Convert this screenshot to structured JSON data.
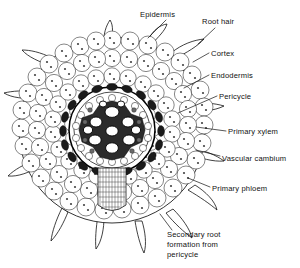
{
  "figure": {
    "background_color": "#ffffff",
    "ink_color": "#111111",
    "width": 300,
    "height": 268
  },
  "labels": [
    {
      "id": "epidermis",
      "text": "Epidermis",
      "lines": [
        "Epidermis"
      ],
      "x": 140,
      "y": 17,
      "anchor": "start"
    },
    {
      "id": "root-hair",
      "text": "Root hair",
      "lines": [
        "Root hair"
      ],
      "x": 202,
      "y": 24,
      "anchor": "start"
    },
    {
      "id": "cortex",
      "text": "Cortex",
      "lines": [
        "Cortex"
      ],
      "x": 211,
      "y": 56,
      "anchor": "start"
    },
    {
      "id": "endodermis",
      "text": "Endodermis",
      "lines": [
        "Endodermis"
      ],
      "x": 211,
      "y": 78,
      "anchor": "start"
    },
    {
      "id": "pericycle",
      "text": "Pericycle",
      "lines": [
        "Pericycle"
      ],
      "x": 219,
      "y": 99,
      "anchor": "start"
    },
    {
      "id": "primary-xylem",
      "text": "Primary xylem",
      "lines": [
        "Primary xylem"
      ],
      "x": 228,
      "y": 134,
      "anchor": "start"
    },
    {
      "id": "vascular-cambium",
      "text": "Vascular cambium",
      "lines": [
        "Vascular cambium"
      ],
      "x": 222,
      "y": 161,
      "anchor": "start"
    },
    {
      "id": "primary-phloem",
      "text": "Primary phloem",
      "lines": [
        "Primary phloem"
      ],
      "x": 212,
      "y": 191,
      "anchor": "start"
    },
    {
      "id": "secondary-root",
      "text": "Secondary root formation from pericycle",
      "lines": [
        "Secondary root",
        "formation from",
        "pericycle"
      ],
      "x": 167,
      "y": 237,
      "anchor": "start"
    }
  ],
  "structures": [
    {
      "id": "root-outline",
      "name": "root cross-section outline"
    },
    {
      "id": "epidermis-layer",
      "name": "epidermis cell layer"
    },
    {
      "id": "cortex-layer",
      "name": "cortex parenchyma cells"
    },
    {
      "id": "endodermis-ring",
      "name": "endodermis ring"
    },
    {
      "id": "pericycle-ring",
      "name": "pericycle layer"
    },
    {
      "id": "xylem-star",
      "name": "primary xylem vessels"
    },
    {
      "id": "phloem-patches",
      "name": "primary phloem"
    },
    {
      "id": "secondary-root",
      "name": "emerging secondary root"
    },
    {
      "id": "root-hairs",
      "name": "root hairs"
    }
  ]
}
